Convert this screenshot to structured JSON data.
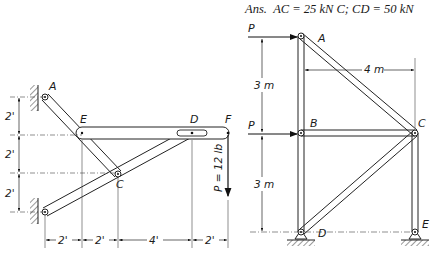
{
  "answer": {
    "prefix": "Ans.",
    "text": "AC = 25 kN C; CD = 50 kN"
  },
  "left_figure": {
    "joints": [
      "A",
      "E",
      "D",
      "F",
      "C"
    ],
    "load_label": "P = 12 lb",
    "vertical_dims": [
      "2'",
      "2'",
      "2'"
    ],
    "horizontal_dims": [
      "2'",
      "2'",
      "4'",
      "2'"
    ]
  },
  "right_figure": {
    "joints": [
      "A",
      "B",
      "C",
      "D",
      "E"
    ],
    "loads": [
      "P",
      "P"
    ],
    "vertical_dims": [
      "3 m",
      "3 m"
    ],
    "horizontal_dim": "4 m"
  }
}
